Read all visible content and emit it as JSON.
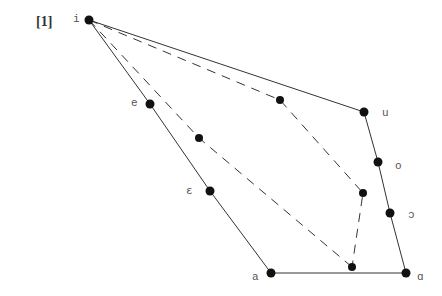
{
  "figure_number": "[1]",
  "vowels": [
    {
      "label": "i",
      "x": 89,
      "y": 20,
      "lx": 73,
      "ly": 13
    },
    {
      "label": "e",
      "x": 150,
      "y": 104,
      "lx": 131,
      "ly": 97
    },
    {
      "label": "ε",
      "x": 210,
      "y": 191,
      "lx": 186,
      "ly": 185
    },
    {
      "label": "a",
      "x": 271,
      "y": 273,
      "lx": 252,
      "ly": 271
    },
    {
      "label": "ɑ",
      "x": 406,
      "y": 273,
      "lx": 417,
      "ly": 271
    },
    {
      "label": "ɔ",
      "x": 390,
      "y": 213,
      "lx": 408,
      "ly": 209
    },
    {
      "label": "o",
      "x": 378,
      "y": 162,
      "lx": 395,
      "ly": 160
    },
    {
      "label": "u",
      "x": 364,
      "y": 112,
      "lx": 382,
      "ly": 107
    }
  ],
  "inner_points": [
    {
      "x": 280,
      "y": 100
    },
    {
      "x": 199,
      "y": 138
    },
    {
      "x": 363,
      "y": 193
    },
    {
      "x": 352,
      "y": 267
    }
  ],
  "dashed_paths": [
    [
      [
        89,
        20
      ],
      [
        280,
        100
      ],
      [
        363,
        193
      ],
      [
        352,
        267
      ]
    ],
    [
      [
        89,
        20
      ],
      [
        199,
        138
      ],
      [
        352,
        267
      ]
    ]
  ],
  "colors": {
    "line": "#333333",
    "dot": "#111111"
  }
}
